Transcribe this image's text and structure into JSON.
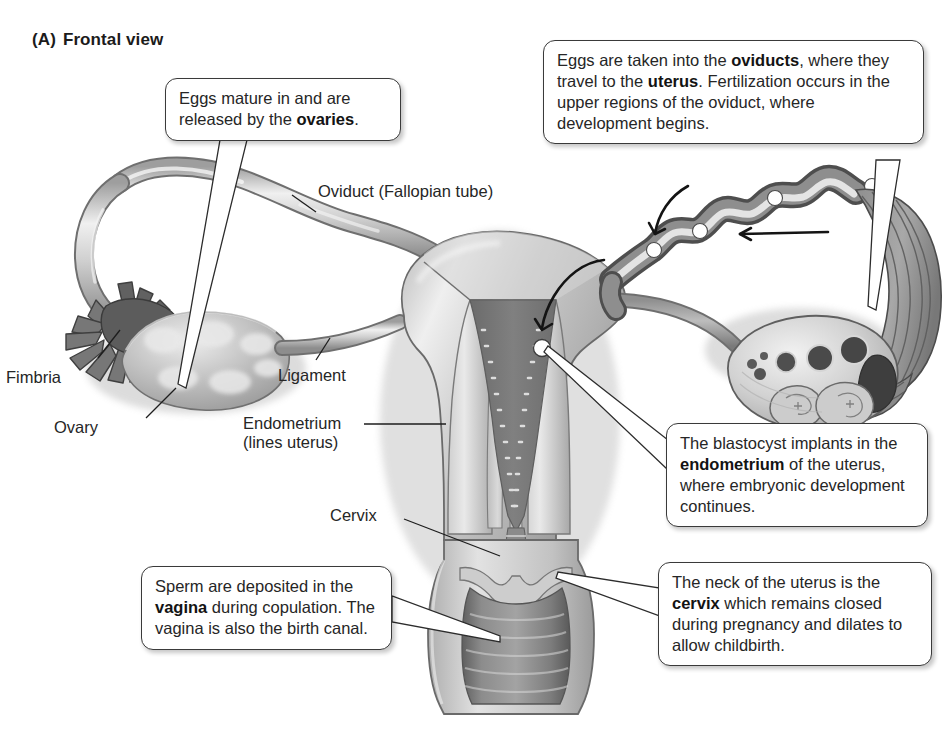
{
  "figure": {
    "panel_letter": "(A)",
    "panel_title": "Frontal view"
  },
  "labels": [
    {
      "name": "oviduct",
      "text": "Oviduct (Fallopian tube)"
    },
    {
      "name": "fimbria",
      "text": "Fimbria"
    },
    {
      "name": "ovary",
      "text": "Ovary"
    },
    {
      "name": "ligament",
      "text": "Ligament"
    },
    {
      "name": "endometrium",
      "line1": "Endometrium",
      "line2": "(lines uterus)"
    },
    {
      "name": "cervix",
      "text": "Cervix"
    }
  ],
  "callouts": {
    "ovaries": {
      "id": "callout-ovaries",
      "segments": [
        {
          "t": "Eggs mature in and are released by the ",
          "b": false
        },
        {
          "t": "ovaries",
          "b": true
        },
        {
          "t": ".",
          "b": false
        }
      ]
    },
    "oviducts": {
      "id": "callout-oviducts",
      "segments": [
        {
          "t": "Eggs are taken into the ",
          "b": false
        },
        {
          "t": "oviducts",
          "b": true
        },
        {
          "t": ", where they travel to the ",
          "b": false
        },
        {
          "t": "uterus",
          "b": true
        },
        {
          "t": ". Fertilization occurs in the upper regions of the oviduct, where development begins.",
          "b": false
        }
      ]
    },
    "blastocyst": {
      "id": "callout-blastocyst",
      "segments": [
        {
          "t": "The blastocyst implants in the ",
          "b": false
        },
        {
          "t": "endometrium",
          "b": true
        },
        {
          "t": " of the uterus, where embryonic development continues.",
          "b": false
        }
      ]
    },
    "cervix": {
      "id": "callout-cervix",
      "segments": [
        {
          "t": "The neck of the uterus is the ",
          "b": false
        },
        {
          "t": "cervix",
          "b": true
        },
        {
          "t": " which remains closed during pregnancy and dilates to allow childbirth.",
          "b": false
        }
      ]
    },
    "vagina": {
      "id": "callout-vagina",
      "segments": [
        {
          "t": "Sperm are deposited in the ",
          "b": false
        },
        {
          "t": "vagina",
          "b": true
        },
        {
          "t": " during copulation. The vagina is also the birth canal.",
          "b": false
        }
      ]
    }
  },
  "colors": {
    "background": "#ffffff",
    "ink": "#262626",
    "outline": "#3a3a3a",
    "tissue_light": "#d8d8d8",
    "tissue_mid": "#b4b4b4",
    "tissue_dark": "#8a8a8a",
    "lumen_dark": "#6d6d6d",
    "endometrium": "#c9c9c9"
  },
  "illustration": {
    "name": "female-reproductive-tract-frontal-view",
    "parts": [
      "left-oviduct",
      "left-fimbria",
      "left-ovary",
      "left-ligament",
      "uterus-body",
      "uterus-cutaway",
      "endometrium-lining",
      "uterine-cavity",
      "cervix",
      "vagina",
      "right-oviduct",
      "right-fimbria",
      "right-ovary-cross-section",
      "follicles",
      "corpus-luteum",
      "egg-travel-markers",
      "direction-arrows",
      "blastocyst-marker"
    ]
  }
}
